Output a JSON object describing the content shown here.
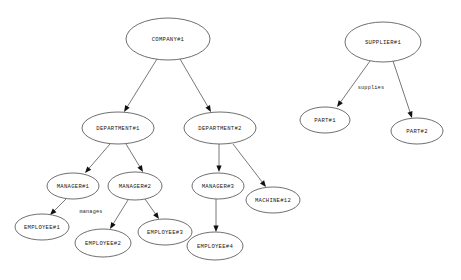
{
  "diagram": {
    "background_color": "#ffffff",
    "node_fill_color": "#ffffff",
    "node_stroke_color": "#4a4a4a",
    "edge_color": "#555555",
    "arrowhead_color": "#111111",
    "text_color": "#1a1a1a",
    "nodes": [
      {
        "id": "company1",
        "label": "COMPANY#1",
        "cx": 168,
        "cy": 39,
        "rx": 42,
        "ry": 21
      },
      {
        "id": "department1",
        "label": "DEPARTMENT#1",
        "cx": 118,
        "cy": 128,
        "rx": 36,
        "ry": 16
      },
      {
        "id": "department2",
        "label": "DEPARTMENT#2",
        "cx": 220,
        "cy": 128,
        "rx": 36,
        "ry": 16
      },
      {
        "id": "manager1",
        "label": "MANAGER#1",
        "cx": 73,
        "cy": 186,
        "rx": 26,
        "ry": 13
      },
      {
        "id": "manager2",
        "label": "MANAGER#2",
        "cx": 135,
        "cy": 186,
        "rx": 27,
        "ry": 14
      },
      {
        "id": "manager3",
        "label": "MANAGER#3",
        "cx": 218,
        "cy": 186,
        "rx": 26,
        "ry": 13
      },
      {
        "id": "machine12",
        "label": "MACHINE#12",
        "cx": 273,
        "cy": 200,
        "rx": 27,
        "ry": 13
      },
      {
        "id": "employee1",
        "label": "EMPLOYEE#1",
        "cx": 42,
        "cy": 227,
        "rx": 27,
        "ry": 13
      },
      {
        "id": "employee2",
        "label": "EMPLOYEE#2",
        "cx": 103,
        "cy": 243,
        "rx": 28,
        "ry": 14
      },
      {
        "id": "employee3",
        "label": "EMPLOYEE#3",
        "cx": 165,
        "cy": 232,
        "rx": 27,
        "ry": 13
      },
      {
        "id": "employee4",
        "label": "EMPLOYEE#4",
        "cx": 215,
        "cy": 246,
        "rx": 28,
        "ry": 14
      },
      {
        "id": "supplier1",
        "label": "SUPPLIER#1",
        "cx": 383,
        "cy": 42,
        "rx": 38,
        "ry": 20
      },
      {
        "id": "part1",
        "label": "PART#1",
        "cx": 325,
        "cy": 120,
        "rx": 25,
        "ry": 13
      },
      {
        "id": "part2",
        "label": "PART#2",
        "cx": 417,
        "cy": 131,
        "rx": 26,
        "ry": 13
      }
    ],
    "edges": [
      {
        "id": "company1-department1",
        "from": "company1",
        "to": "department1",
        "x1": 157,
        "y1": 59,
        "x2": 124,
        "y2": 112,
        "label": ""
      },
      {
        "id": "company1-department2",
        "from": "company1",
        "to": "department2",
        "x1": 180,
        "y1": 59,
        "x2": 211,
        "y2": 112,
        "label": ""
      },
      {
        "id": "department1-manager1",
        "from": "department1",
        "to": "manager1",
        "x1": 110,
        "y1": 144,
        "x2": 85,
        "y2": 173,
        "label": ""
      },
      {
        "id": "department1-manager2",
        "from": "department1",
        "to": "manager2",
        "x1": 126,
        "y1": 144,
        "x2": 143,
        "y2": 172,
        "label": ""
      },
      {
        "id": "department2-manager3",
        "from": "department2",
        "to": "manager3",
        "x1": 219,
        "y1": 144,
        "x2": 219,
        "y2": 172,
        "label": ""
      },
      {
        "id": "department2-machine12",
        "from": "department2",
        "to": "machine12",
        "x1": 233,
        "y1": 144,
        "x2": 266,
        "y2": 187,
        "label": ""
      },
      {
        "id": "manager1-employee1",
        "from": "manager1",
        "to": "employee1",
        "x1": 66,
        "y1": 199,
        "x2": 50,
        "y2": 215,
        "label": "manages"
      },
      {
        "id": "manager2-employee2",
        "from": "manager2",
        "to": "employee2",
        "x1": 128,
        "y1": 200,
        "x2": 110,
        "y2": 229,
        "label": ""
      },
      {
        "id": "manager2-employee3",
        "from": "manager2",
        "to": "employee3",
        "x1": 145,
        "y1": 199,
        "x2": 159,
        "y2": 219,
        "label": ""
      },
      {
        "id": "manager3-employee4",
        "from": "manager3",
        "to": "employee4",
        "x1": 216,
        "y1": 199,
        "x2": 216,
        "y2": 232,
        "label": ""
      },
      {
        "id": "supplier1-part1",
        "from": "supplier1",
        "to": "part1",
        "x1": 370,
        "y1": 61,
        "x2": 337,
        "y2": 107,
        "label": "supplies"
      },
      {
        "id": "supplier1-part2",
        "from": "supplier1",
        "to": "part2",
        "x1": 393,
        "y1": 61,
        "x2": 412,
        "y2": 118,
        "label": ""
      }
    ],
    "edge_labels": [
      {
        "id": "manages-label",
        "text": "manages",
        "x": 91,
        "y": 212
      },
      {
        "id": "supplies-label",
        "text": "supplies",
        "x": 371,
        "y": 88
      }
    ]
  }
}
